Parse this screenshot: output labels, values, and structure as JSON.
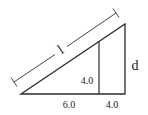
{
  "diagram": {
    "colors": {
      "line": "#2b2b2b",
      "dim_line": "#444444",
      "text": "#222222"
    },
    "labels": {
      "hypotenuse": "l",
      "inner_height": "4.0",
      "base_left": "6.0",
      "base_right": "4.0",
      "outer_height": "d"
    },
    "shapes": {
      "triangle": {
        "vertices": [
          [
            21,
            94
          ],
          [
            125,
            24
          ],
          [
            125,
            94
          ]
        ]
      },
      "inner_vertical": {
        "x": 99,
        "y_top": 42,
        "y_bottom": 94
      },
      "dimension_line": {
        "from": [
          14,
          82
        ],
        "to": [
          116,
          13
        ],
        "label_at": [
          61,
          50
        ]
      }
    }
  }
}
